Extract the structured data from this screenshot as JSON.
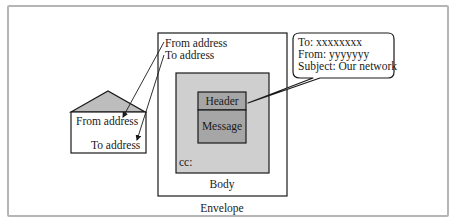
{
  "colors": {
    "frame_border": "#b5b5b5",
    "background": "#ffffff",
    "body_fill": "#cfcfcf",
    "inner_fill": "#a6a6a6",
    "flap_fill": "#bdbdbd",
    "stroke": "#1a1a1a"
  },
  "small_envelope": {
    "from_label": "From address",
    "to_label": "To address"
  },
  "envelope": {
    "from_label": "From address",
    "to_label": "To address",
    "caption": "Envelope",
    "body": {
      "caption": "Body",
      "cc_label": "cc:",
      "header_label": "Header",
      "message_label": "Message"
    }
  },
  "callout": {
    "lines": [
      "To: xxxxxxxx",
      "From: yyyyyyy",
      "Subject: Our network"
    ]
  }
}
